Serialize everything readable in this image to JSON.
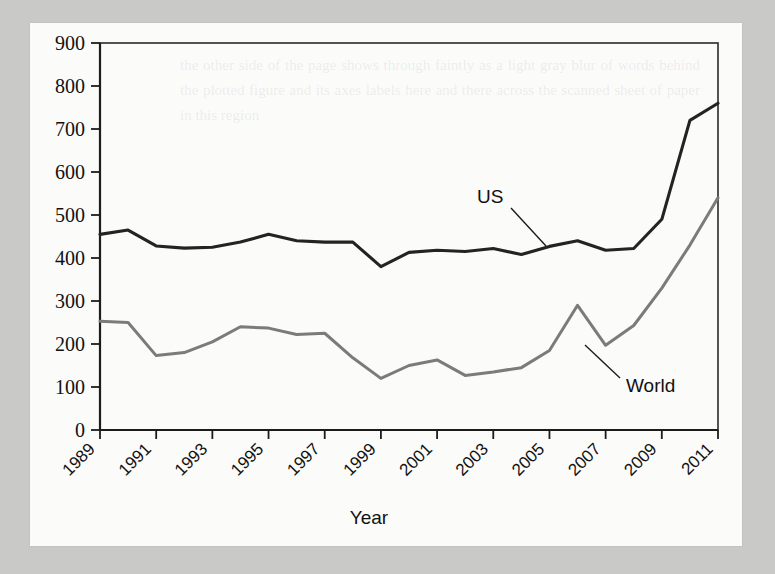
{
  "chart_data": {
    "type": "line",
    "title": "",
    "xlabel": "Year",
    "ylabel": "",
    "xlim": [
      1989,
      2011
    ],
    "ylim": [
      0,
      900
    ],
    "grid": false,
    "legend_position": "inline-annotations",
    "x": [
      1989,
      1990,
      1991,
      1992,
      1993,
      1994,
      1995,
      1996,
      1997,
      1998,
      1999,
      2000,
      2001,
      2002,
      2003,
      2004,
      2005,
      2006,
      2007,
      2008,
      2009,
      2010,
      2011
    ],
    "xticks": [
      "1989",
      "1991",
      "1993",
      "1995",
      "1997",
      "1999",
      "2001",
      "2003",
      "2005",
      "2007",
      "2009",
      "2011"
    ],
    "yticks": [
      "0",
      "100",
      "200",
      "300",
      "400",
      "500",
      "600",
      "700",
      "800",
      "900"
    ],
    "series": [
      {
        "name": "US",
        "color": "#232323",
        "values": [
          455,
          465,
          428,
          423,
          425,
          437,
          455,
          440,
          437,
          437,
          380,
          413,
          418,
          415,
          422,
          408,
          427,
          440,
          418,
          422,
          490,
          720,
          760
        ]
      },
      {
        "name": "World",
        "color": "#7b7b7b",
        "values": [
          253,
          250,
          173,
          180,
          205,
          240,
          237,
          222,
          225,
          168,
          120,
          150,
          163,
          127,
          135,
          145,
          185,
          290,
          197,
          243,
          330,
          430,
          540
        ]
      }
    ],
    "annotations": [
      {
        "text": "US",
        "target_series": "US",
        "target_x": 2003
      },
      {
        "text": "World",
        "target_series": "World",
        "target_x": 2007
      }
    ]
  },
  "page": {
    "background_color": "#c9c9c7",
    "paper_color": "#fbfbfa",
    "ghost_text": "the other side of the page shows through faintly as a light gray blur of words behind the plotted figure and its axes labels here and there across the scanned sheet of paper in this region"
  }
}
